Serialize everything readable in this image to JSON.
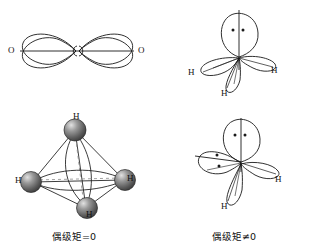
{
  "figure": {
    "title_hidden": "",
    "background": "#ffffff",
    "stroke": "#1a1a1a"
  },
  "panels": [
    {
      "id": "co2",
      "molecule": "CO2",
      "description": "linear sp hybrid orbital diagram",
      "labels": [
        {
          "text": "O",
          "position": "left"
        },
        {
          "text": "O",
          "position": "right"
        }
      ],
      "lone_pairs": 0,
      "caption": ""
    },
    {
      "id": "nh3",
      "molecule": "NH3",
      "description": "pyramidal sp3 hybrid orbital diagram with one lone pair",
      "labels": [
        {
          "text": "H",
          "position": "left"
        },
        {
          "text": "H",
          "position": "bottom"
        },
        {
          "text": "H",
          "position": "right"
        }
      ],
      "lone_pairs": 1,
      "caption": ""
    },
    {
      "id": "ch4",
      "molecule": "CH4",
      "description": "tetrahedral ball model with four hydrogen spheres",
      "labels": [
        {
          "text": "H",
          "position": "top"
        },
        {
          "text": "H",
          "position": "left"
        },
        {
          "text": "H",
          "position": "bottom"
        },
        {
          "text": "H",
          "position": "right"
        }
      ],
      "lone_pairs": 0,
      "caption": "偶级矩=0"
    },
    {
      "id": "h2o",
      "molecule": "H2O",
      "description": "bent sp3 hybrid orbital diagram with two lone pairs",
      "labels": [
        {
          "text": "H",
          "position": "bottom"
        },
        {
          "text": "H",
          "position": "right"
        }
      ],
      "lone_pairs": 2,
      "caption": "偶级矩≠0"
    }
  ],
  "captions": {
    "left": "偶级矩=0",
    "right": "偶级矩≠0"
  },
  "atom_labels": {
    "co2_o_left": "O",
    "co2_o_right": "O",
    "nh3_h_left": "H",
    "nh3_h_bottom": "H",
    "nh3_h_right": "H",
    "ch4_h_top": "H",
    "ch4_h_left": "H",
    "ch4_h_bottom": "H",
    "ch4_h_right": "H",
    "h2o_h_bottom": "H",
    "h2o_h_right": "H"
  },
  "colors": {
    "line": "#1a1a1a",
    "sphere_dark": "#4a4a4a",
    "sphere_mid": "#6e6e6e",
    "sphere_light": "#d8d8d8",
    "dashed": "#8a8a8a"
  }
}
